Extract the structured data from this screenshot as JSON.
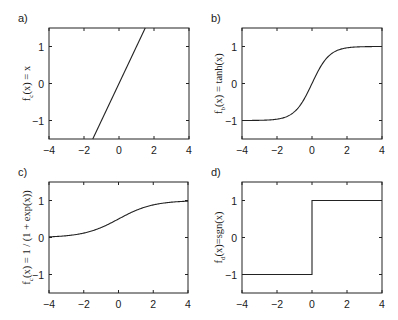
{
  "chart_data": [
    {
      "panel": "a)",
      "type": "line",
      "ylabel": "f_c(x) = x",
      "ylabel_main": "f",
      "ylabel_sub": "c",
      "ylabel_rest": "(x) = x",
      "function": "linear",
      "xlim": [
        -4,
        4
      ],
      "ylim": [
        -1.5,
        1.5
      ],
      "xticks": [
        -4,
        -2,
        0,
        2,
        4
      ],
      "yticks": [
        -1,
        0,
        1
      ],
      "x": [
        -1.5,
        1.5
      ],
      "y": [
        -1.5,
        1.5
      ],
      "grid": false
    },
    {
      "panel": "b)",
      "type": "line",
      "ylabel": "f_b(x) = tanh(x)",
      "ylabel_main": "f",
      "ylabel_sub": "b",
      "ylabel_rest": "(x) = tanh(x)",
      "function": "tanh",
      "xlim": [
        -4,
        4
      ],
      "ylim": [
        -1.5,
        1.5
      ],
      "xticks": [
        -4,
        -2,
        0,
        2,
        4
      ],
      "yticks": [
        -1,
        0,
        1
      ],
      "x": [
        -4,
        -3,
        -2,
        -1,
        0,
        1,
        2,
        3,
        4
      ],
      "y": [
        -1.0,
        -0.995,
        -0.964,
        -0.762,
        0,
        0.762,
        0.964,
        0.995,
        1.0
      ],
      "grid": false
    },
    {
      "panel": "c)",
      "type": "line",
      "ylabel": "f_c(x) = 1 / (1 + exp(x))",
      "ylabel_main": "f",
      "ylabel_sub": "c",
      "ylabel_rest": "(x) = 1 / (1 + exp(x))",
      "function": "sigmoid",
      "xlim": [
        -4,
        4
      ],
      "ylim": [
        -1.5,
        1.5
      ],
      "xticks": [
        -4,
        -2,
        0,
        2,
        4
      ],
      "yticks": [
        -1,
        0,
        1
      ],
      "x": [
        -4,
        -3,
        -2,
        -1,
        0,
        1,
        2,
        3,
        4
      ],
      "y": [
        0.018,
        0.047,
        0.119,
        0.269,
        0.5,
        0.731,
        0.881,
        0.953,
        0.982
      ],
      "grid": false
    },
    {
      "panel": "d)",
      "type": "line",
      "ylabel": "f_d(x)=sgn(x)",
      "ylabel_main": "f",
      "ylabel_sub": "d",
      "ylabel_rest": "(x)=sgn(x)",
      "function": "sign",
      "xlim": [
        -4,
        4
      ],
      "ylim": [
        -1.5,
        1.5
      ],
      "xticks": [
        -4,
        -2,
        0,
        2,
        4
      ],
      "yticks": [
        -1,
        0,
        1
      ],
      "x": [
        -4,
        0,
        0,
        4
      ],
      "y": [
        -1,
        -1,
        1,
        1
      ],
      "grid": false
    }
  ],
  "panels": [
    {
      "label": "a)"
    },
    {
      "label": "b)"
    },
    {
      "label": "c)"
    },
    {
      "label": "d)"
    }
  ]
}
